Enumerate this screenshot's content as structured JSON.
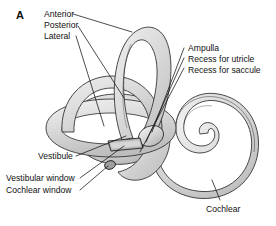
{
  "figure": {
    "panel_letter": "A",
    "background_color": "#ffffff",
    "ink_color": "#111111",
    "structure_fill_light": "#e8e8e8",
    "structure_fill_mid": "#d2d2d2",
    "structure_fill_dark": "#b6b6b6",
    "outline_color": "#2a2a2a"
  },
  "labels": {
    "left_top_group": [
      {
        "id": "anterior",
        "text": "Anterior"
      },
      {
        "id": "posterior",
        "text": "Posterior"
      },
      {
        "id": "lateral",
        "text": "Lateral"
      }
    ],
    "right_top_group": [
      {
        "id": "ampulla",
        "text": "Ampulla"
      },
      {
        "id": "recess-utricle",
        "text": "Recess for utricle"
      },
      {
        "id": "recess-saccule",
        "text": "Recess for saccule"
      }
    ],
    "left_bottom_group": [
      {
        "id": "vestibule",
        "text": "Vestibule"
      },
      {
        "id": "vestibular-window",
        "text": "Vestibular window"
      },
      {
        "id": "cochlear-window",
        "text": "Cochlear window"
      }
    ],
    "bottom_right_group": [
      {
        "id": "cochlear",
        "text": "Cochlear"
      }
    ]
  }
}
